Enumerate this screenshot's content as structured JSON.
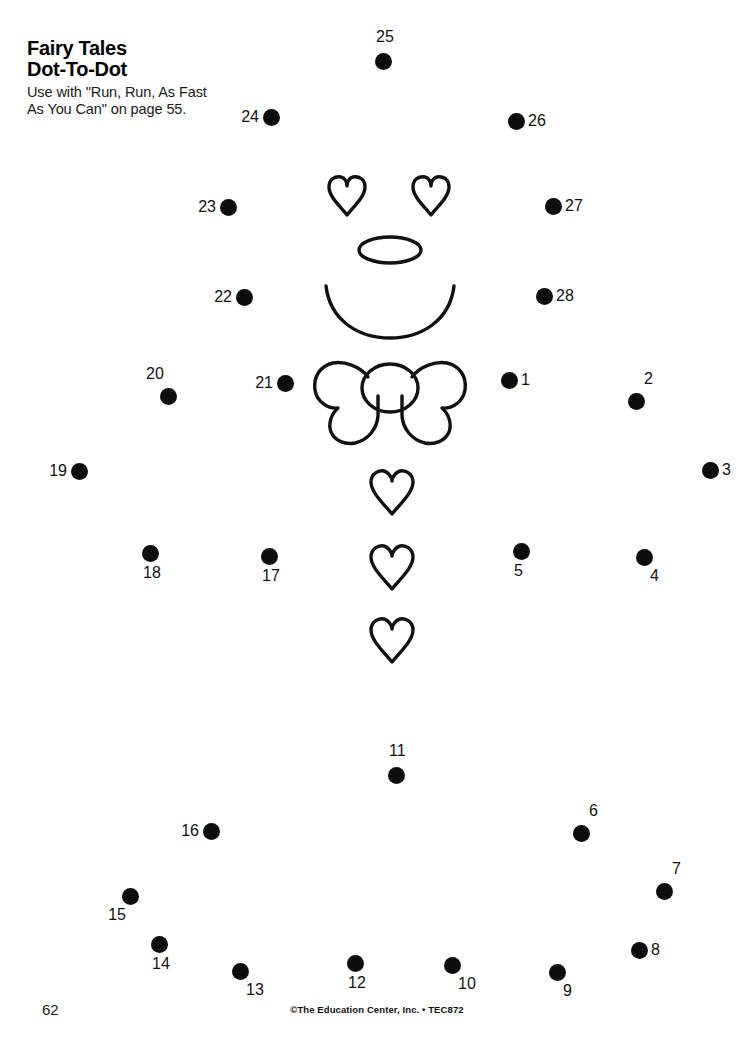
{
  "header": {
    "title_line1": "Fairy Tales",
    "title_line2": "Dot-To-Dot",
    "instructions": "Use with \"Run, Run, As Fast\nAs You Can\" on page 55."
  },
  "footer": {
    "page_number": "62",
    "copyright": "©The Education Center, Inc. • TEC872"
  },
  "colors": {
    "ink": "#0d0d0d",
    "paper": "#ffffff",
    "label": "#111111"
  },
  "puzzle": {
    "dot_count": 28,
    "dot_radius": 8.5,
    "dots": [
      {
        "n": "1",
        "x": 509,
        "y": 380,
        "label_pos": "right"
      },
      {
        "n": "2",
        "x": 636,
        "y": 401,
        "label_pos": "above-right"
      },
      {
        "n": "3",
        "x": 710,
        "y": 470,
        "label_pos": "right"
      },
      {
        "n": "4",
        "x": 644,
        "y": 557,
        "label_pos": "below-right"
      },
      {
        "n": "5",
        "x": 521,
        "y": 551,
        "label_pos": "below"
      },
      {
        "n": "6",
        "x": 581,
        "y": 833,
        "label_pos": "above-right"
      },
      {
        "n": "7",
        "x": 664,
        "y": 891,
        "label_pos": "above-right"
      },
      {
        "n": "8",
        "x": 639,
        "y": 950,
        "label_pos": "right"
      },
      {
        "n": "9",
        "x": 557,
        "y": 972,
        "label_pos": "below-right"
      },
      {
        "n": "10",
        "x": 452,
        "y": 965,
        "label_pos": "below-right"
      },
      {
        "n": "11",
        "x": 396,
        "y": 775,
        "label_pos": "above"
      },
      {
        "n": "12",
        "x": 355,
        "y": 963,
        "label_pos": "below"
      },
      {
        "n": "13",
        "x": 240,
        "y": 971,
        "label_pos": "below-right"
      },
      {
        "n": "14",
        "x": 159,
        "y": 944,
        "label_pos": "below"
      },
      {
        "n": "15",
        "x": 130,
        "y": 896,
        "label_pos": "below-left"
      },
      {
        "n": "16",
        "x": 211,
        "y": 831,
        "label_pos": "left"
      },
      {
        "n": "17",
        "x": 269,
        "y": 556,
        "label_pos": "below"
      },
      {
        "n": "18",
        "x": 150,
        "y": 553,
        "label_pos": "below"
      },
      {
        "n": "19",
        "x": 79,
        "y": 471,
        "label_pos": "left"
      },
      {
        "n": "20",
        "x": 168,
        "y": 396,
        "label_pos": "above-left"
      },
      {
        "n": "21",
        "x": 285,
        "y": 383,
        "label_pos": "left"
      },
      {
        "n": "22",
        "x": 244,
        "y": 297,
        "label_pos": "left"
      },
      {
        "n": "23",
        "x": 228,
        "y": 207,
        "label_pos": "left"
      },
      {
        "n": "24",
        "x": 271,
        "y": 117,
        "label_pos": "left"
      },
      {
        "n": "25",
        "x": 383,
        "y": 61,
        "label_pos": "above"
      },
      {
        "n": "26",
        "x": 516,
        "y": 121,
        "label_pos": "right"
      },
      {
        "n": "27",
        "x": 553,
        "y": 206,
        "label_pos": "right"
      },
      {
        "n": "28",
        "x": 544,
        "y": 296,
        "label_pos": "right"
      }
    ],
    "figure_parts": [
      "left-heart-eye",
      "right-heart-eye",
      "oval-nose",
      "smile-arc",
      "bow-tie",
      "body-heart-top",
      "body-heart-middle",
      "body-heart-bottom"
    ]
  }
}
